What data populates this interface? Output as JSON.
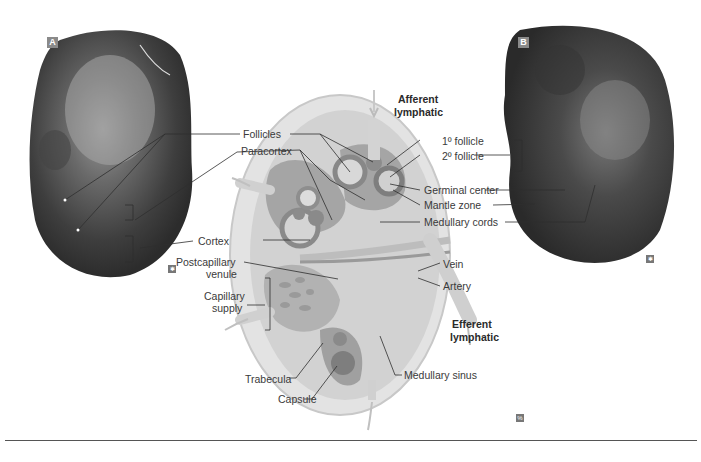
{
  "panels": {
    "a": {
      "tag": "A"
    },
    "b": {
      "tag": "B"
    }
  },
  "labels": {
    "follicles": "Follicles",
    "paracortex": "Paracortex",
    "cortex": "Cortex",
    "postcapillary_venule_1": "Postcapillary",
    "postcapillary_venule_2": "venule",
    "capillary_supply_1": "Capillary",
    "capillary_supply_2": "supply",
    "trabecula": "Trabecula",
    "capsule": "Capsule",
    "afferent_1": "Afferent",
    "afferent_2": "lymphatic",
    "primary_follicle": "1º follicle",
    "secondary_follicle": "2º follicle",
    "germinal_center": "Germinal center",
    "mantle_zone": "Mantle zone",
    "medullary_cords": "Medullary cords",
    "vein": "Vein",
    "artery": "Artery",
    "efferent_1": "Efferent",
    "efferent_2": "lymphatic",
    "medullary_sinus": "Medullary sinus"
  },
  "icons": {
    "micro_a": "✱",
    "micro_b": "✱",
    "diagram": "%"
  }
}
